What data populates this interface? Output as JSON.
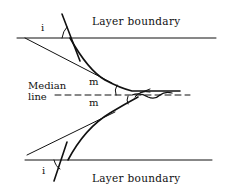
{
  "diagram": {
    "top_boundary_label": "Layer boundary",
    "bottom_boundary_label": "Layer boundary",
    "median_label_line1": "Median",
    "median_label_line2": "line",
    "top_angle_label": "i",
    "bottom_angle_label": "i",
    "upper_median_angle_label": "m",
    "lower_median_angle_label": "m",
    "colors": {
      "ink": "#111111",
      "background": "#ffffff"
    }
  }
}
